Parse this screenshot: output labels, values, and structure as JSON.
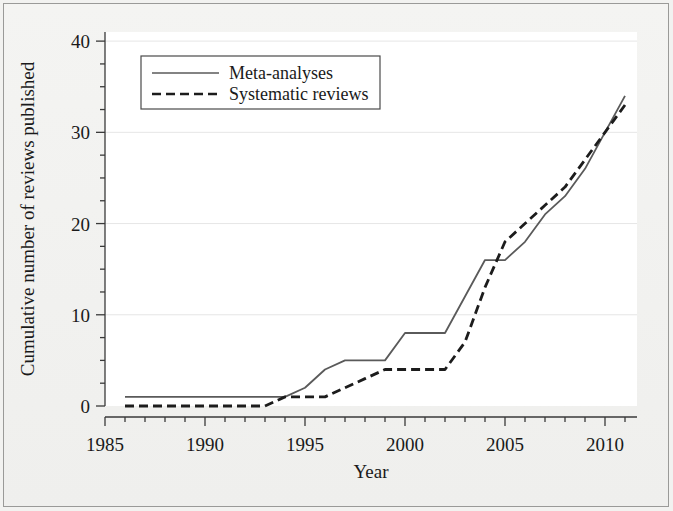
{
  "chart_data": {
    "type": "line",
    "title": "",
    "xlabel": "Year",
    "ylabel": "Cumulative number of reviews published",
    "xlim": [
      1985,
      2011.6
    ],
    "ylim": [
      0,
      41
    ],
    "grid": true,
    "grid_style": "light horizontal gridlines at major y ticks",
    "legend_position": "upper left inside plot",
    "x_major_ticks": [
      1985,
      1990,
      1995,
      2000,
      2005,
      2010
    ],
    "x_major_tick_labels": [
      "1985",
      "1990",
      "1995",
      "2000",
      "2005",
      "2010"
    ],
    "x_minor_tick_interval": 1,
    "y_major_ticks": [
      0,
      10,
      20,
      30,
      40
    ],
    "y_major_tick_labels": [
      "0",
      "10",
      "20",
      "30",
      "40"
    ],
    "y_minor_tick_interval": 2.5,
    "series": [
      {
        "name": "Meta-analyses",
        "style": "solid",
        "color": "#5a5a5a",
        "x": [
          1986,
          1987,
          1988,
          1989,
          1990,
          1991,
          1992,
          1993,
          1994,
          1995,
          1996,
          1997,
          1998,
          1999,
          2000,
          2001,
          2002,
          2003,
          2004,
          2005,
          2006,
          2007,
          2008,
          2009,
          2010,
          2011
        ],
        "values": [
          1,
          1,
          1,
          1,
          1,
          1,
          1,
          1,
          1,
          2,
          4,
          5,
          5,
          5,
          8,
          8,
          8,
          12,
          16,
          16,
          18,
          21,
          23,
          26,
          30,
          34
        ]
      },
      {
        "name": "Systematic reviews",
        "style": "dashed",
        "color": "#1c1c1c",
        "x": [
          1986,
          1987,
          1988,
          1989,
          1990,
          1991,
          1992,
          1993,
          1994,
          1995,
          1996,
          1997,
          1998,
          1999,
          2000,
          2001,
          2002,
          2003,
          2004,
          2005,
          2006,
          2007,
          2008,
          2009,
          2010,
          2011
        ],
        "values": [
          0,
          0,
          0,
          0,
          0,
          0,
          0,
          0,
          1,
          1,
          1,
          2,
          3,
          4,
          4,
          4,
          4,
          7,
          13,
          18,
          20,
          22,
          24,
          27,
          30,
          33
        ]
      }
    ]
  },
  "legend": {
    "items": [
      {
        "label": "Meta-analyses",
        "style": "solid"
      },
      {
        "label": "Systematic reviews",
        "style": "dashed"
      }
    ]
  },
  "axes": {
    "x_title": "Year",
    "y_title": "Cumulative number of reviews published"
  },
  "colors": {
    "meta_analyses_line": "#5a5a5a",
    "systematic_reviews_line": "#1c1c1c",
    "axis": "#3a3a3a",
    "gridline": "#e6e6e6",
    "plot_background": "#ffffff",
    "figure_background": "#f2f2f0",
    "figure_border": "#9a9a98",
    "text": "#1a1a1a"
  }
}
